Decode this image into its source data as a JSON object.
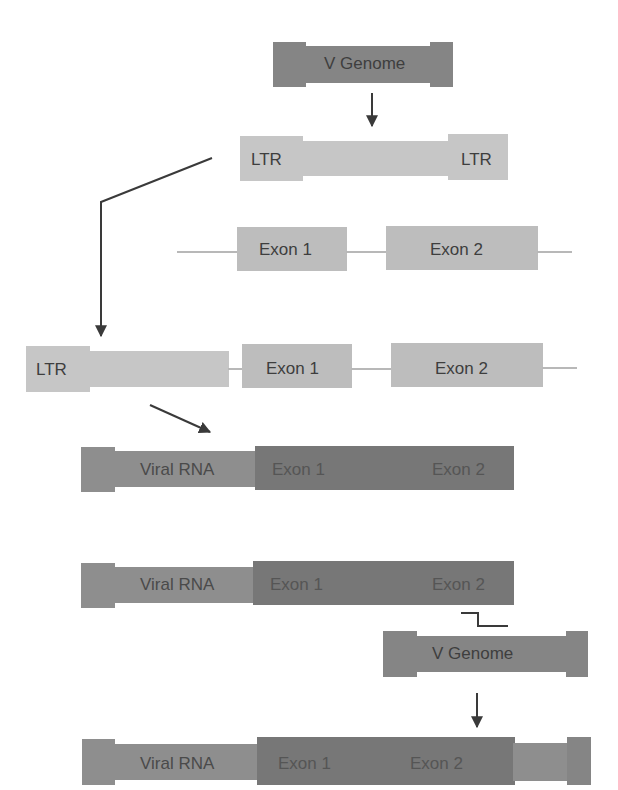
{
  "colors": {
    "genome_dark": "#858585",
    "ltr_light": "#c6c6c6",
    "exon_light": "#bdbdbd",
    "viral_rna": "#8e8e8e",
    "exon_dark": "#777777",
    "line": "#3a3a3a",
    "intron_line": "#b8b8b8"
  },
  "row1": {
    "label": "V Genome"
  },
  "row2": {
    "ltr_left": "LTR",
    "ltr_right": "LTR"
  },
  "row3": {
    "exon1": "Exon 1",
    "exon2": "Exon 2"
  },
  "row4": {
    "ltr": "LTR",
    "exon1": "Exon 1",
    "exon2": "Exon 2"
  },
  "row5": {
    "viral_rna": "Viral RNA",
    "exon1": "Exon 1",
    "exon2": "Exon 2"
  },
  "row6": {
    "viral_rna": "Viral RNA",
    "exon1": "Exon 1",
    "exon2": "Exon 2"
  },
  "row7": {
    "label": "V Genome"
  },
  "row8": {
    "viral_rna": "Viral RNA",
    "exon1": "Exon 1",
    "exon2": "Exon 2"
  }
}
